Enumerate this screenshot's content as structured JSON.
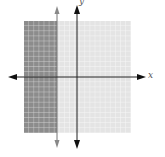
{
  "graph": {
    "x_label": "x",
    "y_label": "y",
    "grid": {
      "x_min": -10,
      "x_max": 10,
      "y_min": -10,
      "y_max": 10,
      "step": 1
    },
    "boundary": {
      "type": "vertical-line",
      "x": -4,
      "style": "solid",
      "color": "#777777"
    },
    "shaded_region": {
      "description": "x < -4",
      "color": "#8c8c8c"
    },
    "unshaded_region_color": "#e6e6e6",
    "axis_color": "#111111"
  }
}
